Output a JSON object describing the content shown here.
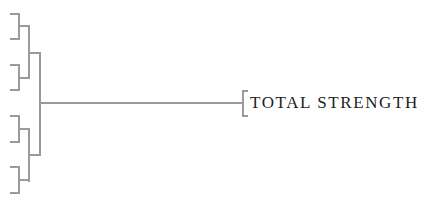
{
  "diagram": {
    "type": "bracket-tree",
    "root": {
      "label": "TOTAL STRENGTH"
    },
    "leaves": [
      {
        "label": ""
      },
      {
        "label": ""
      },
      {
        "label": ""
      },
      {
        "label": ""
      },
      {
        "label": ""
      },
      {
        "label": ""
      },
      {
        "label": ""
      },
      {
        "label": ""
      }
    ],
    "colors": {
      "line": "#9a9a9a",
      "text": "#222222",
      "background": "#ffffff"
    }
  }
}
